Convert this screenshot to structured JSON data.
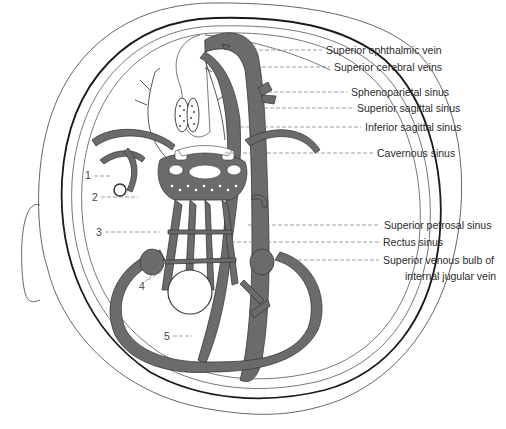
{
  "figure": {
    "labels_right": [
      {
        "id": "superior-ophthalmic-vein",
        "text": "Superior ophthalmic vein",
        "x": 326,
        "y": 44,
        "line_y": 50,
        "line_from": 235
      },
      {
        "id": "superior-cerebral-veins",
        "text": "Superior cerebral veins",
        "x": 334,
        "y": 61,
        "line_y": 67,
        "line_from": 262
      },
      {
        "id": "sphenoparietal-sinus",
        "text": "Sphenoparietal sinus",
        "x": 351,
        "y": 86,
        "line_y": 92,
        "line_from": 256
      },
      {
        "id": "superior-sagittal-sinus",
        "text": "Superior sagittal sinus",
        "x": 357,
        "y": 102,
        "line_y": 108,
        "line_from": 264
      },
      {
        "id": "inferior-sagittal-sinus",
        "text": "Inferior sagittal sinus",
        "x": 365,
        "y": 121,
        "line_y": 127,
        "line_from": 240
      },
      {
        "id": "cavernous-sinus",
        "text": "Cavernous sinus",
        "x": 377,
        "y": 147,
        "line_y": 153,
        "line_from": 225
      },
      {
        "id": "superior-petrosal-sinus",
        "text": "Superior petrosal sinus",
        "x": 384,
        "y": 219,
        "line_y": 225,
        "line_from": 248
      },
      {
        "id": "rectus-sinus",
        "text": "Rectus sinus",
        "x": 383,
        "y": 236,
        "line_y": 242,
        "line_from": 225
      },
      {
        "id": "superior-venous-bulb",
        "text": "Superior venous bulb of",
        "x": 383,
        "y": 254,
        "line_y": 260,
        "line_from": 240
      },
      {
        "id": "internal-jugular-vein",
        "text": "internal jugular vein",
        "x": 405,
        "y": 270
      }
    ],
    "labels_numbered": [
      {
        "id": "label-1",
        "text": "1",
        "x": 85,
        "y": 169,
        "line_y": 176,
        "line_to": 112
      },
      {
        "id": "label-2",
        "text": "2",
        "x": 92,
        "y": 191,
        "line_y": 197,
        "line_to": 138
      },
      {
        "id": "label-3",
        "text": "3",
        "x": 96,
        "y": 226,
        "line_y": 232,
        "line_to": 160
      },
      {
        "id": "label-4",
        "text": "4",
        "x": 139,
        "y": 280
      },
      {
        "id": "label-5",
        "text": "5",
        "x": 164,
        "y": 330,
        "line_y": 336,
        "line_to": 192
      }
    ],
    "colors": {
      "sinus_fill": "#6b6b6b",
      "sinus_stroke": "#3a3a3a",
      "outline": "#1a1a1a",
      "thin_line": "#555555",
      "leader": "#666666",
      "background": "#ffffff"
    }
  }
}
